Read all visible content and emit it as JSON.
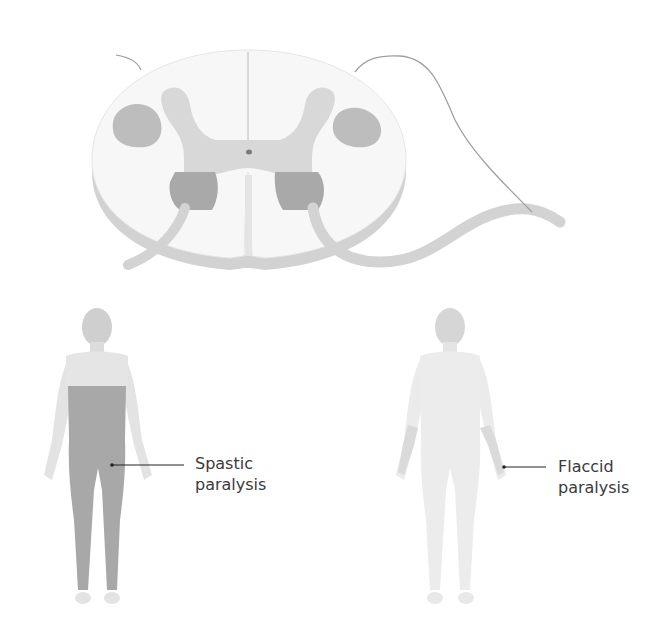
{
  "figure": {
    "spinal_cord": {
      "name": "spinal-cord-cross-section",
      "colors": {
        "white_matter": "#f6f6f6",
        "gray_matter": "#d6d6d6",
        "lateral_tract": "#bdbdbd",
        "anterior_horn_lesion": "#a9a9a9",
        "edge": "#cfcfcf",
        "nerve_root": "#d9d9d9"
      }
    },
    "figures": [
      {
        "name": "spastic-figure",
        "label_line1": "Spastic",
        "label_line2": "paralysis",
        "shaded_region": "trunk-and-legs",
        "shade_color": "#a8a8a8",
        "body_color": "#e2e2e2"
      },
      {
        "name": "flaccid-figure",
        "label_line1": "Flaccid",
        "label_line2": "paralysis",
        "shaded_region": "forearm-and-hand",
        "shade_color": "#dadada",
        "body_color": "#ececec"
      }
    ]
  }
}
